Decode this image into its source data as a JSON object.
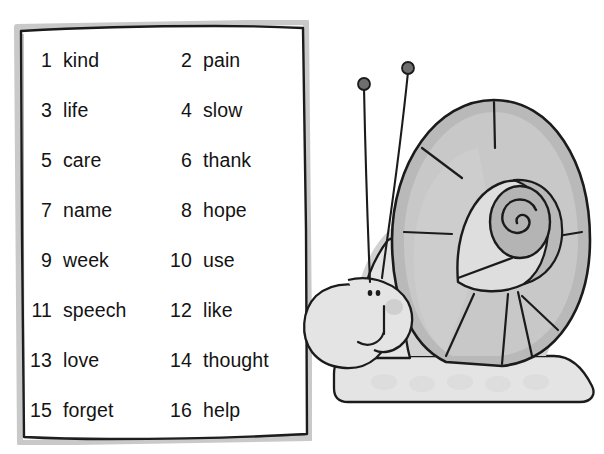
{
  "page": {
    "width": 604,
    "height": 454,
    "background": "#ffffff"
  },
  "top_ghost_text": "",
  "word_box": {
    "border_color": "#1a1a1a",
    "shadow_color": "#c8c8c8",
    "fill": "#ffffff",
    "columns": 2,
    "entries": [
      {
        "number": "1",
        "word": "kind"
      },
      {
        "number": "2",
        "word": "pain"
      },
      {
        "number": "3",
        "word": "life"
      },
      {
        "number": "4",
        "word": "slow"
      },
      {
        "number": "5",
        "word": "care"
      },
      {
        "number": "6",
        "word": "thank"
      },
      {
        "number": "7",
        "word": "name"
      },
      {
        "number": "8",
        "word": "hope"
      },
      {
        "number": "9",
        "word": "week"
      },
      {
        "number": "10",
        "word": "use"
      },
      {
        "number": "11",
        "word": "speech"
      },
      {
        "number": "12",
        "word": "like"
      },
      {
        "number": "13",
        "word": "love"
      },
      {
        "number": "14",
        "word": "thought"
      },
      {
        "number": "15",
        "word": "forget"
      },
      {
        "number": "16",
        "word": "help"
      }
    ]
  },
  "illustration": {
    "subject": "snail",
    "outline_color": "#1a1a1a",
    "palette": {
      "body_light": "#e2e2e2",
      "body_mid": "#cfcfcf",
      "shell_light": "#e0e0e0",
      "shell_mid": "#c6c6c6",
      "shell_dark": "#b2b2b2",
      "antenna_tip": "#6e6e6e",
      "blush": "#c9c9c9"
    },
    "parts": [
      "shell",
      "spiral-center",
      "head",
      "eye-left",
      "eye-right",
      "mouth",
      "antenna-left",
      "antenna-right",
      "body",
      "foot"
    ]
  }
}
